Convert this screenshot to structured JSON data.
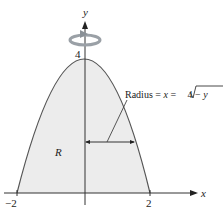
{
  "figure": {
    "type": "region-under-parabola-revolved-about-y-axis",
    "axes": {
      "x_label": "x",
      "y_label": "y",
      "x_ticks": [
        "−2",
        "2"
      ],
      "y_ticks": [
        "4"
      ]
    },
    "curve": {
      "equation": "y = 4 − x²",
      "vertex": [
        0,
        4
      ],
      "roots": [
        -2,
        2
      ]
    },
    "region_label": "R",
    "annotation": {
      "prefix": "Radius = ",
      "var_x": "x",
      "equals": " = ",
      "radical_body": "4 − ",
      "radical_var": "y"
    },
    "rotation_icon": "rotation-arrow-about-y-axis",
    "colors": {
      "region_fill": "#ececec",
      "curve": "#555555",
      "axis": "#333333",
      "rotation_arrow": "#9aa0a6"
    }
  }
}
